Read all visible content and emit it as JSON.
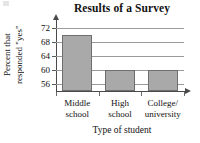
{
  "chart_data": {
    "type": "bar",
    "title": "Results of a Survey",
    "xlabel": "Type of student",
    "ylabel": "Percent that responded \"yes\"",
    "ylabel_line1": "Percent that",
    "ylabel_line2": "responded \"yes\"",
    "categories": [
      "Middle school",
      "High school",
      "College/ university"
    ],
    "category_lines": [
      [
        "Middle",
        "school"
      ],
      [
        "High",
        "school"
      ],
      [
        "College/",
        "university"
      ]
    ],
    "values": [
      70,
      60,
      60
    ],
    "ylim": [
      54,
      73
    ],
    "yticks": [
      72,
      68,
      64,
      60,
      56
    ],
    "ytick_labels": [
      "72",
      "68",
      "64",
      "60",
      "56"
    ],
    "grid": true,
    "legend": "none",
    "bar_fill_color": "#a9a9a9",
    "bar_edge_color": "#6e6e6e",
    "axis_color": "#4a4a4a",
    "grid_color": "#9a9a9a",
    "background_color": "#ffffff"
  }
}
